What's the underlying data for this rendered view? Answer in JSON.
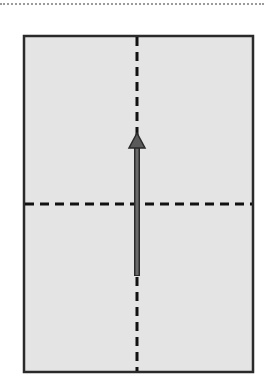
{
  "diagram": {
    "type": "rectangle-with-center-axes-and-arrow",
    "colors": {
      "fill": "#e4e4e4",
      "border": "#2a2a2a",
      "dashed_axis": "#111111",
      "arrow": "#5a5a5a",
      "top_rule": "#9a9a9a"
    },
    "rectangle": {
      "x": 24,
      "y": 36,
      "width": 229,
      "height": 336
    },
    "vertical_axis": {
      "x": 137,
      "y1": 36,
      "y2": 372
    },
    "horizontal_axis": {
      "y": 204,
      "x1": 24,
      "x2": 253
    },
    "arrow": {
      "x": 137,
      "y_start": 276,
      "y_end": 133,
      "direction": "up"
    }
  }
}
